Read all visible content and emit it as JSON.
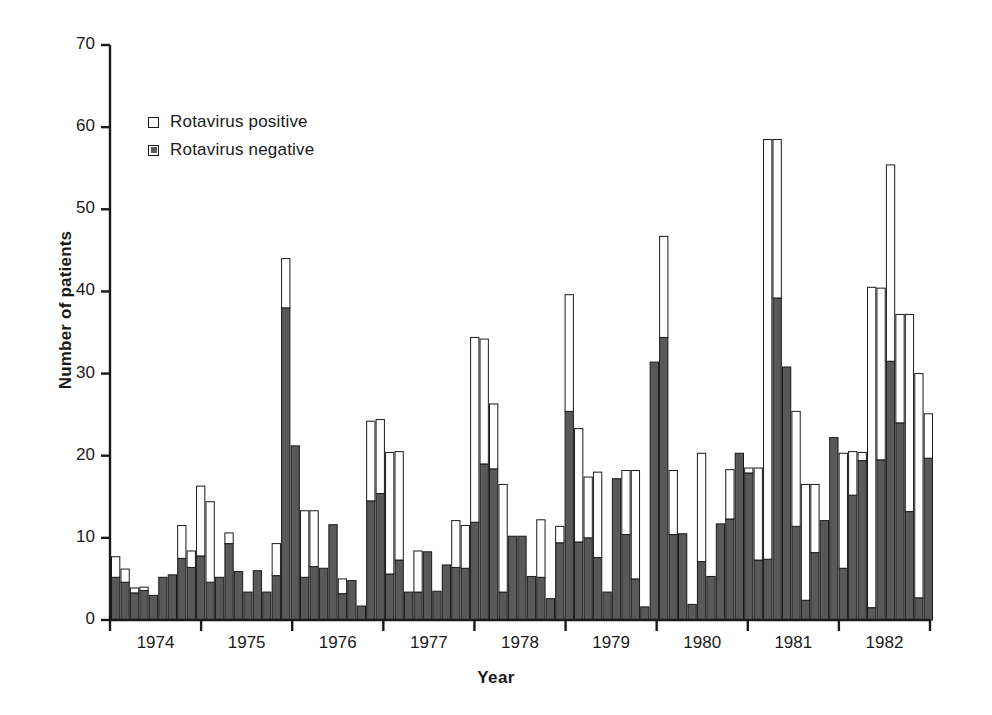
{
  "chart_data": {
    "type": "bar",
    "subtype": "stacked",
    "title": "",
    "xlabel": "Year",
    "ylabel": "Number of patients",
    "ylim": [
      0,
      70
    ],
    "yticks": [
      0,
      10,
      20,
      30,
      40,
      50,
      60,
      70
    ],
    "grid": false,
    "legend_position": "upper-left",
    "colors": {
      "positive": "#ffffff",
      "negative": "#595959",
      "outline": "#1a1a1a",
      "background": "#ffffff"
    },
    "legend": [
      {
        "key": "positive",
        "label": "Rotavirus positive"
      },
      {
        "key": "negative",
        "label": "Rotavirus negative"
      }
    ],
    "xtick_labels": [
      "1974",
      "1975",
      "1976",
      "1977",
      "1978",
      "1979",
      "1980",
      "1981",
      "1982"
    ],
    "series": [
      {
        "name": "Rotavirus negative",
        "key": "negative",
        "values": [
          5.2,
          4.6,
          3.3,
          3.6,
          3.0,
          5.2,
          5.5,
          7.5,
          6.4,
          7.8,
          4.6,
          5.2,
          9.3,
          5.9,
          3.4,
          6.0,
          3.4,
          5.4,
          38.0,
          21.2,
          5.2,
          6.5,
          6.3,
          11.6,
          3.2,
          4.8,
          1.7,
          14.5,
          15.4,
          5.6,
          7.3,
          3.4,
          3.4,
          8.3,
          3.5,
          6.7,
          6.4,
          6.3,
          11.9,
          19.0,
          18.4,
          3.4,
          10.2,
          10.2,
          5.3,
          5.2,
          2.6,
          9.4,
          25.4,
          9.5,
          10.0,
          7.6,
          3.4,
          17.2,
          10.4,
          5.0,
          1.6,
          31.4,
          34.4,
          10.4,
          10.5,
          1.9,
          7.1,
          5.3,
          11.7,
          12.3,
          20.3,
          17.9,
          7.3,
          7.4,
          39.2,
          30.8,
          11.4,
          2.4,
          8.2,
          12.1,
          22.2,
          6.3,
          15.2,
          19.4,
          1.5,
          19.5,
          31.5,
          24.0,
          13.2,
          2.7,
          19.7
        ],
        "color": "#595959"
      },
      {
        "name": "Rotavirus positive",
        "key": "positive",
        "values": [
          2.5,
          1.6,
          0.6,
          0.4,
          0.2,
          0.3,
          0.2,
          4.0,
          2.0,
          8.5,
          9.8,
          0.2,
          1.3,
          0.2,
          0.2,
          0.2,
          0.2,
          3.9,
          6.0,
          0.2,
          8.1,
          6.8,
          0.3,
          0.2,
          1.8,
          0.2,
          0.2,
          9.7,
          9.0,
          14.8,
          13.2,
          0.2,
          5.0,
          0.2,
          0.2,
          0.2,
          5.7,
          5.2,
          22.5,
          15.2,
          7.9,
          13.1,
          0.3,
          0.2,
          0.2,
          7.0,
          0.2,
          2.0,
          14.2,
          13.8,
          7.4,
          10.4,
          0.2,
          0.2,
          7.8,
          13.2,
          0.2,
          0.3,
          12.3,
          7.8,
          0.2,
          0.2,
          13.2,
          0.2,
          0.3,
          6.0,
          0.2,
          0.6,
          11.2,
          51.1,
          19.3,
          0.2,
          14.0,
          14.1,
          8.3,
          0.3,
          0.2,
          14.0,
          5.3,
          1.0,
          39.0,
          20.9,
          23.9,
          13.2,
          24.0,
          27.3,
          5.4
        ],
        "color": "#ffffff"
      }
    ]
  },
  "axis": {
    "y_title": "Number of patients",
    "x_title": "Year"
  }
}
